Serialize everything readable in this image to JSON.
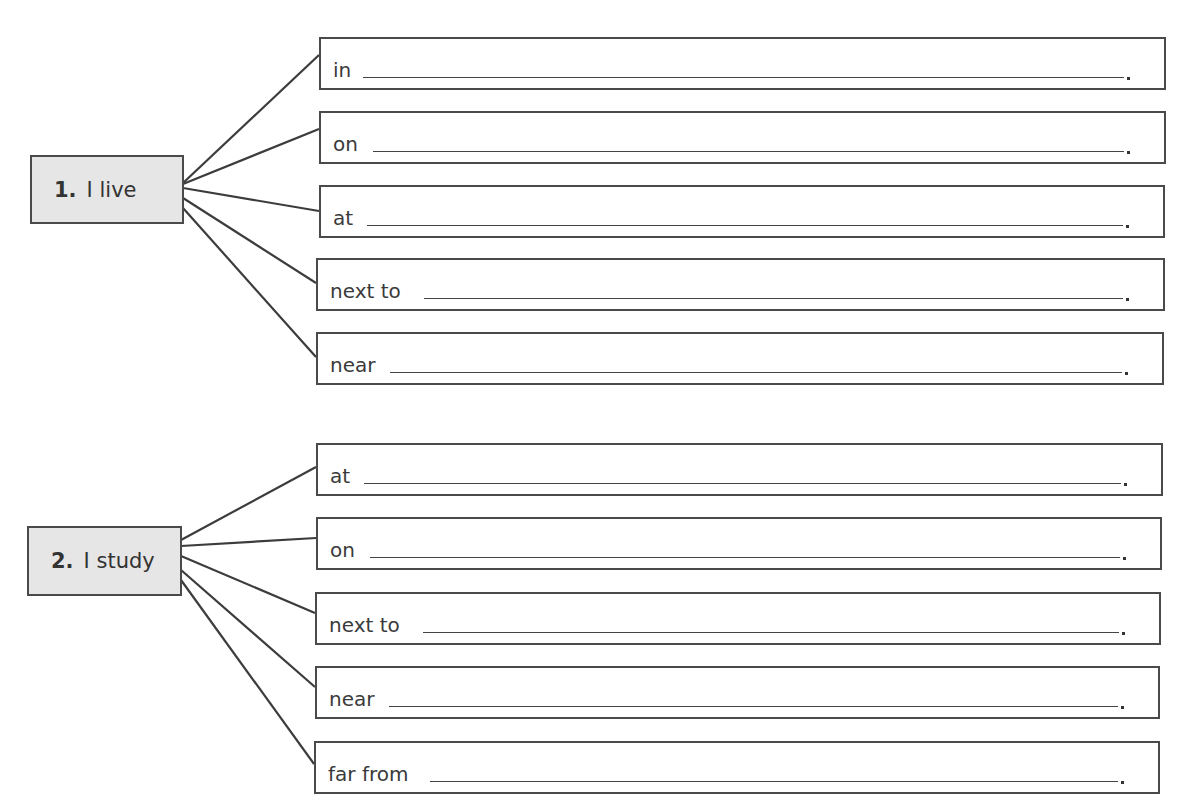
{
  "exercises": [
    {
      "number": "1.",
      "stem": "I live",
      "blanks": [
        {
          "prompt": "in",
          "answer": "",
          "end": "."
        },
        {
          "prompt": "on",
          "answer": "",
          "end": "."
        },
        {
          "prompt": "at",
          "answer": "",
          "end": "."
        },
        {
          "prompt": "next to",
          "answer": "",
          "end": "."
        },
        {
          "prompt": "near",
          "answer": "",
          "end": "."
        }
      ]
    },
    {
      "number": "2.",
      "stem": "I study",
      "blanks": [
        {
          "prompt": "at",
          "answer": "",
          "end": "."
        },
        {
          "prompt": "on",
          "answer": "",
          "end": "."
        },
        {
          "prompt": "next to",
          "answer": "",
          "end": "."
        },
        {
          "prompt": "near",
          "answer": "",
          "end": "."
        },
        {
          "prompt": "far from",
          "answer": "",
          "end": "."
        }
      ]
    }
  ],
  "colors": {
    "stem_fill": "#e6e6e6",
    "border": "#4a4a4a",
    "text": "#3a3a3a"
  }
}
